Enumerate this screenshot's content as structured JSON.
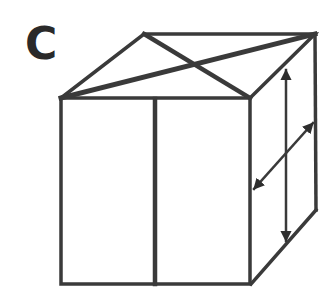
{
  "figure": {
    "label": "C",
    "stroke_color": "#3a3a3a"
  }
}
